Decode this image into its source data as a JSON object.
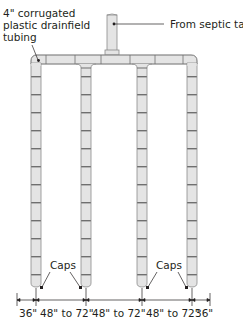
{
  "diagram": {
    "type": "drainfield-layout",
    "colors": {
      "pipe_fill": "#e4e4e4",
      "pipe_stroke": "#8a8a8a",
      "segment_line": "#6f6f6f",
      "leader": "#231f20",
      "text": "#231f20"
    },
    "labels": {
      "tubing_line1": "4\" corrugated",
      "tubing_line2": "plastic drainfield",
      "tubing_line3": "tubing",
      "inlet": "From septic tank",
      "caps_left": "Caps",
      "caps_right": "Caps"
    },
    "dimensions": [
      {
        "label": "36\""
      },
      {
        "label": "48\" to 72\""
      },
      {
        "label": "48\" to 72\""
      },
      {
        "label": "48\" to 72\""
      },
      {
        "label": "36\""
      }
    ],
    "legs": [
      {
        "name": "leg-1"
      },
      {
        "name": "leg-2"
      },
      {
        "name": "leg-3"
      },
      {
        "name": "leg-4"
      }
    ]
  }
}
